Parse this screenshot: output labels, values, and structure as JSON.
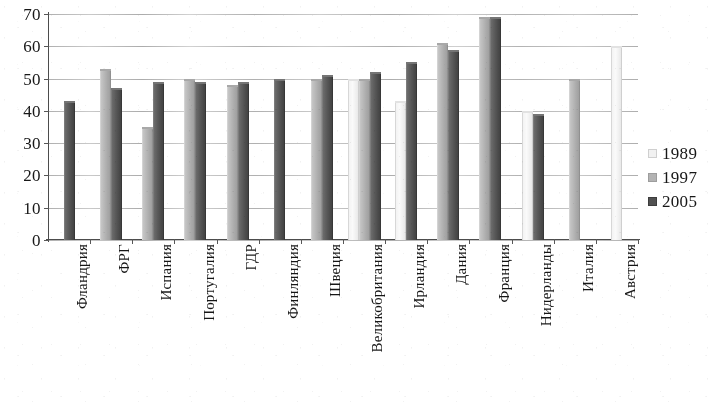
{
  "chart_data": {
    "type": "bar",
    "title": "",
    "xlabel": "",
    "ylabel": "",
    "ylim": [
      0,
      70
    ],
    "ytick_step": 10,
    "yticks": [
      "0",
      "10",
      "20",
      "30",
      "40",
      "50",
      "60",
      "70"
    ],
    "grid": true,
    "legend_position": "right",
    "categories": [
      "Фландрия",
      "ФРГ",
      "Испания",
      "Португалия",
      "ГДР",
      "Финляндия",
      "Швеция",
      "Великобритания",
      "Ирландия",
      "Дания",
      "Франция",
      "Нидерланды",
      "Италия",
      "Австрия"
    ],
    "series": [
      {
        "name": "1989",
        "color": "#f2f2f2",
        "values": [
          null,
          null,
          null,
          null,
          null,
          null,
          null,
          50,
          43,
          null,
          null,
          40,
          null,
          60
        ]
      },
      {
        "name": "1997",
        "color": "#b3b3b3",
        "values": [
          null,
          53,
          35,
          50,
          48,
          null,
          50,
          50,
          null,
          61,
          69,
          null,
          50,
          null
        ]
      },
      {
        "name": "2005",
        "color": "#4f4f4f",
        "values": [
          43,
          47,
          49,
          49,
          49,
          50,
          51,
          52,
          55,
          59,
          69,
          39,
          null,
          null
        ]
      }
    ]
  },
  "legend": {
    "items": [
      {
        "label": "1989",
        "series": "s1989"
      },
      {
        "label": "1997",
        "series": "s1997"
      },
      {
        "label": "2005",
        "series": "s2005"
      }
    ]
  }
}
